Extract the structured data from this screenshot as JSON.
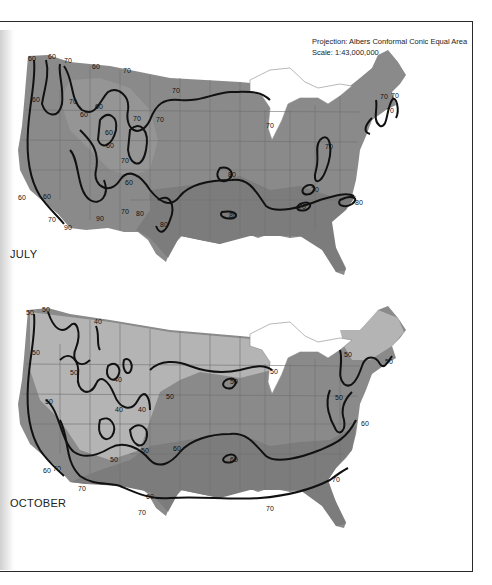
{
  "header": {
    "projection": "Projection: Albers Conformal Conic Equal Area",
    "scale": "Scale: 1:43,000,000"
  },
  "colors": {
    "land_dark": "#7a7a7a",
    "land_mid": "#8f8f8f",
    "land_light": "#a8a8a8",
    "land_lightest": "#bdbdbd",
    "water": "#ffffff",
    "isoline": "#111111",
    "state_border": "#6a6a6a"
  },
  "maps": [
    {
      "label": "JULY",
      "isoline_values": [
        60,
        70,
        80,
        90
      ],
      "isoline_labels": [
        {
          "value": "60",
          "x": 35,
          "y": 59
        },
        {
          "value": "60",
          "x": 50,
          "y": 58
        },
        {
          "value": "70",
          "x": 65,
          "y": 62
        },
        {
          "value": "60",
          "x": 95,
          "y": 67
        },
        {
          "value": "70",
          "x": 125,
          "y": 71
        },
        {
          "value": "70",
          "x": 175,
          "y": 91
        },
        {
          "value": "60",
          "x": 35,
          "y": 100
        },
        {
          "value": "70",
          "x": 70,
          "y": 102
        },
        {
          "value": "60",
          "x": 82,
          "y": 115
        },
        {
          "value": "60",
          "x": 96,
          "y": 107
        },
        {
          "value": "70",
          "x": 135,
          "y": 119
        },
        {
          "value": "70",
          "x": 158,
          "y": 120
        },
        {
          "value": "60",
          "x": 107,
          "y": 133
        },
        {
          "value": "60",
          "x": 108,
          "y": 146
        },
        {
          "value": "70",
          "x": 122,
          "y": 161
        },
        {
          "value": "60",
          "x": 127,
          "y": 183
        },
        {
          "value": "60",
          "x": 45,
          "y": 197
        },
        {
          "value": "60",
          "x": 20,
          "y": 198
        },
        {
          "value": "70",
          "x": 50,
          "y": 220
        },
        {
          "value": "90",
          "x": 66,
          "y": 227
        },
        {
          "value": "90",
          "x": 98,
          "y": 219
        },
        {
          "value": "70",
          "x": 123,
          "y": 212
        },
        {
          "value": "80",
          "x": 138,
          "y": 214
        },
        {
          "value": "80",
          "x": 162,
          "y": 225
        },
        {
          "value": "80",
          "x": 230,
          "y": 175
        },
        {
          "value": "80",
          "x": 231,
          "y": 216
        },
        {
          "value": "70",
          "x": 268,
          "y": 126
        },
        {
          "value": "70",
          "x": 327,
          "y": 147
        },
        {
          "value": "70",
          "x": 313,
          "y": 190
        },
        {
          "value": "70",
          "x": 300,
          "y": 207
        },
        {
          "value": "80",
          "x": 357,
          "y": 203
        },
        {
          "value": "70",
          "x": 382,
          "y": 97
        },
        {
          "value": "70",
          "x": 393,
          "y": 96
        },
        {
          "value": "70",
          "x": 387,
          "y": 111
        }
      ]
    },
    {
      "label": "OCTOBER",
      "isoline_values": [
        40,
        50,
        60,
        70
      ],
      "isoline_labels": [
        {
          "value": "50",
          "x": 28,
          "y": 313
        },
        {
          "value": "50",
          "x": 44,
          "y": 310
        },
        {
          "value": "40",
          "x": 96,
          "y": 322
        },
        {
          "value": "50",
          "x": 34,
          "y": 353
        },
        {
          "value": "50",
          "x": 72,
          "y": 373
        },
        {
          "value": "40",
          "x": 116,
          "y": 380
        },
        {
          "value": "40",
          "x": 117,
          "y": 410
        },
        {
          "value": "50",
          "x": 168,
          "y": 397
        },
        {
          "value": "50",
          "x": 47,
          "y": 402
        },
        {
          "value": "40",
          "x": 140,
          "y": 410
        },
        {
          "value": "50",
          "x": 143,
          "y": 451
        },
        {
          "value": "50",
          "x": 112,
          "y": 460
        },
        {
          "value": "60",
          "x": 175,
          "y": 449
        },
        {
          "value": "60",
          "x": 45,
          "y": 471
        },
        {
          "value": "70",
          "x": 55,
          "y": 469
        },
        {
          "value": "70",
          "x": 80,
          "y": 489
        },
        {
          "value": "60",
          "x": 148,
          "y": 497
        },
        {
          "value": "70",
          "x": 140,
          "y": 513
        },
        {
          "value": "50",
          "x": 232,
          "y": 382
        },
        {
          "value": "50",
          "x": 272,
          "y": 372
        },
        {
          "value": "50",
          "x": 346,
          "y": 355
        },
        {
          "value": "50",
          "x": 387,
          "y": 362
        },
        {
          "value": "50",
          "x": 337,
          "y": 398
        },
        {
          "value": "60",
          "x": 363,
          "y": 424
        },
        {
          "value": "60",
          "x": 232,
          "y": 460
        },
        {
          "value": "70",
          "x": 268,
          "y": 509
        },
        {
          "value": "70",
          "x": 334,
          "y": 480
        }
      ]
    }
  ]
}
